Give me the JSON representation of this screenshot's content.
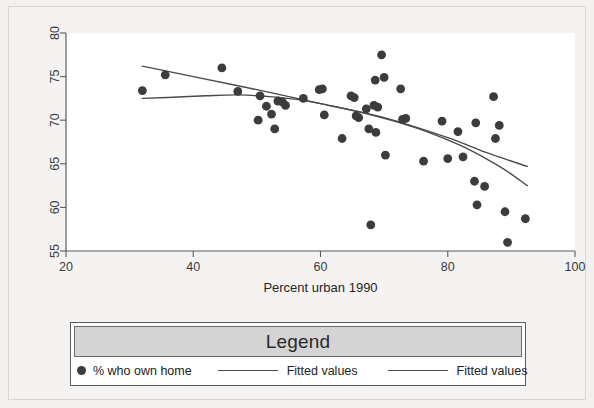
{
  "chart_data": {
    "type": "scatter",
    "title": "",
    "xlabel": "Percent urban 1990",
    "ylabel": "",
    "xlim": [
      20,
      100
    ],
    "ylim": [
      55,
      80
    ],
    "xticks": [
      20,
      40,
      60,
      80,
      100
    ],
    "yticks": [
      55,
      60,
      65,
      70,
      75,
      80
    ],
    "grid": false,
    "legend_position": "below-plot",
    "marker_color": "#3c3c3c",
    "line_color": "#4a4a4a",
    "series": [
      {
        "name": "% who own home",
        "type": "scatter",
        "points": [
          [
            32.0,
            73.4
          ],
          [
            35.6,
            75.2
          ],
          [
            44.5,
            76.0
          ],
          [
            47.0,
            73.3
          ],
          [
            50.2,
            70.0
          ],
          [
            50.5,
            72.8
          ],
          [
            51.5,
            71.6
          ],
          [
            52.3,
            70.7
          ],
          [
            52.8,
            69.0
          ],
          [
            53.3,
            72.2
          ],
          [
            54.0,
            72.1
          ],
          [
            54.5,
            71.7
          ],
          [
            57.3,
            72.5
          ],
          [
            59.8,
            73.5
          ],
          [
            60.3,
            73.6
          ],
          [
            60.6,
            70.6
          ],
          [
            63.4,
            67.9
          ],
          [
            64.8,
            72.8
          ],
          [
            65.3,
            72.6
          ],
          [
            65.6,
            70.5
          ],
          [
            66.0,
            70.3
          ],
          [
            67.2,
            71.3
          ],
          [
            67.6,
            69.0
          ],
          [
            67.9,
            58.0
          ],
          [
            68.4,
            71.7
          ],
          [
            68.6,
            74.6
          ],
          [
            68.7,
            68.6
          ],
          [
            69.0,
            71.5
          ],
          [
            69.6,
            77.5
          ],
          [
            70.0,
            74.9
          ],
          [
            70.2,
            66.0
          ],
          [
            72.6,
            73.6
          ],
          [
            72.9,
            70.1
          ],
          [
            73.4,
            70.2
          ],
          [
            76.2,
            65.3
          ],
          [
            79.1,
            69.9
          ],
          [
            80.0,
            65.6
          ],
          [
            81.6,
            68.7
          ],
          [
            82.4,
            65.8
          ],
          [
            84.2,
            63.0
          ],
          [
            84.4,
            69.7
          ],
          [
            84.6,
            60.3
          ],
          [
            85.8,
            62.4
          ],
          [
            87.2,
            72.7
          ],
          [
            87.5,
            67.9
          ],
          [
            88.1,
            69.4
          ],
          [
            89.0,
            59.5
          ],
          [
            89.4,
            56.0
          ],
          [
            92.2,
            58.7
          ]
        ]
      },
      {
        "name": "Fitted values",
        "type": "line",
        "description": "linear fit, descending",
        "points": [
          [
            32.0,
            76.2
          ],
          [
            40.0,
            75.0
          ],
          [
            50.0,
            73.5
          ],
          [
            60.0,
            71.9
          ],
          [
            70.0,
            70.3
          ],
          [
            80.0,
            68.0
          ],
          [
            86.0,
            66.3
          ],
          [
            92.5,
            64.7
          ]
        ]
      },
      {
        "name": "Fitted values",
        "type": "line",
        "description": "quadratic/lowess fit, flat then steeper decline",
        "points": [
          [
            32.0,
            72.5
          ],
          [
            36.0,
            72.6
          ],
          [
            42.0,
            72.8
          ],
          [
            47.0,
            72.9
          ],
          [
            52.0,
            72.7
          ],
          [
            57.0,
            72.3
          ],
          [
            62.0,
            71.6
          ],
          [
            67.0,
            70.8
          ],
          [
            72.0,
            69.8
          ],
          [
            77.0,
            68.6
          ],
          [
            82.0,
            67.1
          ],
          [
            86.0,
            65.6
          ],
          [
            89.0,
            64.3
          ],
          [
            92.5,
            62.5
          ]
        ]
      }
    ]
  },
  "legend": {
    "title": "Legend",
    "entries": [
      {
        "symbol": "dot",
        "label": "% who own home"
      },
      {
        "symbol": "line",
        "label": "Fitted values"
      },
      {
        "symbol": "line",
        "label": "Fitted values"
      }
    ]
  },
  "axes": {
    "x_title": "Percent urban 1990",
    "x_tick_labels": [
      "20",
      "40",
      "60",
      "80",
      "100"
    ],
    "y_tick_labels": [
      "55",
      "60",
      "65",
      "70",
      "75",
      "80"
    ]
  },
  "colors": {
    "page_background": "#f2f1ef",
    "plot_background": "#ffffff",
    "marker": "#3c3c3c",
    "line": "#4a4a4a",
    "axis": "#5d5d5d",
    "legend_header": "#d4d4d4"
  }
}
